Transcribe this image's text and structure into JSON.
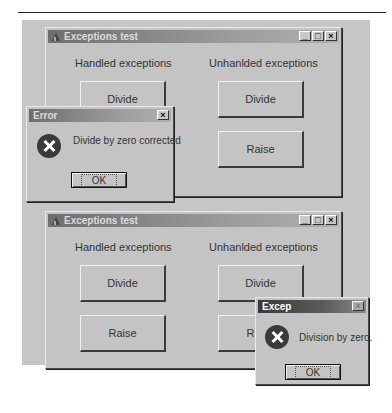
{
  "windows": [
    {
      "title": "Exceptions test",
      "controls": [
        "_",
        "□",
        "×"
      ],
      "groups": {
        "handled": {
          "label": "Handled exceptions",
          "buttons": [
            "Divide",
            "Raise"
          ]
        },
        "unhandled": {
          "label": "Unhanlded exceptions",
          "buttons": [
            "Divide",
            "Raise"
          ]
        }
      }
    },
    {
      "title": "Exceptions test",
      "controls": [
        "_",
        "□",
        "×"
      ],
      "groups": {
        "handled": {
          "label": "Handled exceptions",
          "buttons": [
            "Divide",
            "Raise"
          ]
        },
        "unhandled": {
          "label": "Unhanlded exceptions",
          "buttons": [
            "Divide",
            "Raise"
          ]
        }
      }
    }
  ],
  "dialogs": [
    {
      "title": "Error",
      "icon": "error-icon",
      "message": "Divide by zero corrected",
      "ok_label": "OK",
      "close": "×"
    },
    {
      "title": "Excep",
      "icon": "error-icon",
      "message": "Division by zero.",
      "ok_label": "OK",
      "close": "×"
    }
  ]
}
